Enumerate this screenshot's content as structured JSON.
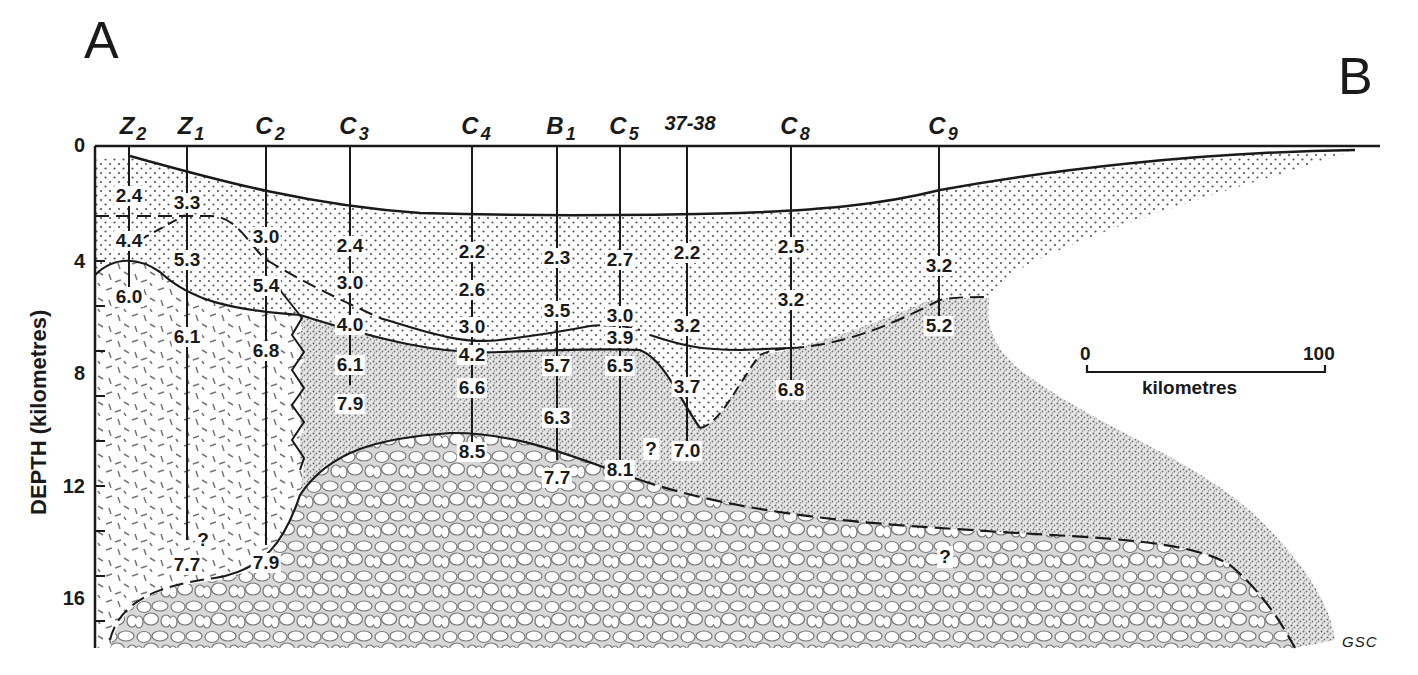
{
  "figure": {
    "corner_left": "A",
    "corner_right": "B",
    "credit": "GSC",
    "y_axis": {
      "label": "DEPTH (kilometres)",
      "ticks": [
        "0",
        "4",
        "8",
        "12",
        "16"
      ]
    },
    "scale_bar": {
      "start": "0",
      "end": "100",
      "unit": "kilometres"
    },
    "stations": [
      {
        "id": "Z2",
        "base": "Z",
        "sub": "2"
      },
      {
        "id": "Z1",
        "base": "Z",
        "sub": "1"
      },
      {
        "id": "C2",
        "base": "C",
        "sub": "2"
      },
      {
        "id": "C3",
        "base": "C",
        "sub": "3"
      },
      {
        "id": "C4",
        "base": "C",
        "sub": "4"
      },
      {
        "id": "B1",
        "base": "B",
        "sub": "1"
      },
      {
        "id": "C5",
        "base": "C",
        "sub": "5"
      },
      {
        "id": "37-38",
        "base": "37-38",
        "sub": ""
      },
      {
        "id": "C8",
        "base": "C",
        "sub": "8"
      },
      {
        "id": "C9",
        "base": "C",
        "sub": "9"
      }
    ],
    "velocities": {
      "Z2": [
        "2.4",
        "4.4",
        "6.0"
      ],
      "Z1": [
        "3.3",
        "5.3",
        "6.1",
        "7.7"
      ],
      "C2": [
        "3.0",
        "5.4",
        "6.8",
        "7.9"
      ],
      "C3": [
        "2.4",
        "3.0",
        "4.0",
        "6.1",
        "7.9"
      ],
      "C4": [
        "2.2",
        "2.6",
        "3.0",
        "4.2",
        "6.6",
        "8.5"
      ],
      "B1": [
        "2.3",
        "3.5",
        "5.7",
        "6.3",
        "7.7"
      ],
      "C5": [
        "2.7",
        "3.0",
        "3.9",
        "6.5",
        "8.1"
      ],
      "37-38": [
        "2.2",
        "3.2",
        "3.7",
        "7.0"
      ],
      "C8": [
        "2.5",
        "3.2",
        "6.8"
      ],
      "C9": [
        "3.2",
        "5.2"
      ]
    },
    "uncertainty_marks": [
      "?",
      "?",
      "?"
    ]
  }
}
